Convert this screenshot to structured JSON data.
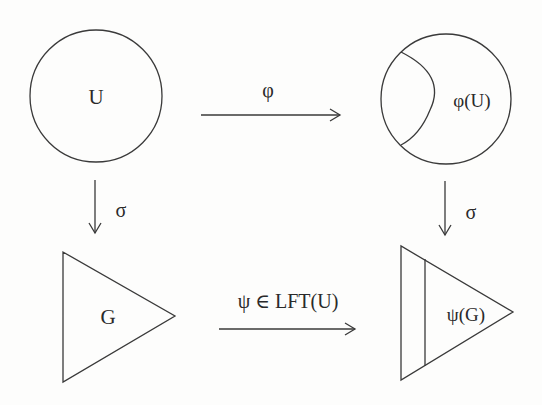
{
  "diagram": {
    "type": "commutative-diagram",
    "nodes": {
      "U": {
        "label": "U",
        "shape": "circle"
      },
      "phiU": {
        "label": "φ(U)",
        "shape": "circle-with-inner-arc"
      },
      "G": {
        "label": "G",
        "shape": "triangle"
      },
      "psiG": {
        "label": "ψ(G)",
        "shape": "triangle-with-inner-line"
      }
    },
    "edges": {
      "top": {
        "from": "U",
        "to": "φ(U)",
        "label": "φ",
        "direction": "right"
      },
      "left": {
        "from": "U",
        "to": "G",
        "label": "σ",
        "direction": "down"
      },
      "right": {
        "from": "φ(U)",
        "to": "ψ(G)",
        "label": "σ",
        "direction": "down"
      },
      "bottom": {
        "from": "G",
        "to": "ψ(G)",
        "label": "ψ ∈ LFT(U)",
        "direction": "right"
      }
    },
    "colors": {
      "stroke": "#3a3a3a",
      "text": "#2a2a2a",
      "background": "#fdfdfc"
    }
  }
}
